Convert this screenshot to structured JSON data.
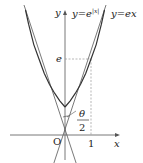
{
  "diagram": {
    "axes": {
      "x_label": "x",
      "y_label": "y",
      "origin_label": "O",
      "x_tick_label": "1",
      "y_tick_label": "e"
    },
    "curves": [
      {
        "name": "y=e^{|x|}",
        "label_prefix": "y=e",
        "label_sup": "|x|"
      },
      {
        "name": "y=ex",
        "label": "y=ex"
      }
    ],
    "angle_label": {
      "numerator": "θ",
      "denominator": "2"
    },
    "colors": {
      "curve": "#333333",
      "tangent": "#555555",
      "axis": "#444444",
      "dashed": "#888888"
    }
  }
}
